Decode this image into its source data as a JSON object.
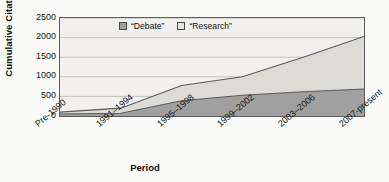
{
  "chart_data": {
    "type": "area",
    "stacked": true,
    "title": "",
    "xlabel": "Period",
    "ylabel": "Cumulative Citations",
    "categories": [
      "Pre-1990",
      "1991–1994",
      "1995–1998",
      "1999–2002",
      "2003–2006",
      "2007-present"
    ],
    "series": [
      {
        "name": "“Debate”",
        "values": [
          50,
          70,
          390,
          530,
          620,
          690
        ],
        "color": "#a0a0a0"
      },
      {
        "name": "“Research”",
        "values": [
          50,
          130,
          390,
          470,
          880,
          1340
        ],
        "color": "#dddbd6"
      }
    ],
    "cumulative_totals": [
      100,
      200,
      780,
      1000,
      1500,
      2030
    ],
    "ylim": [
      0,
      2500
    ],
    "yticks": [
      0,
      500,
      1000,
      1500,
      2000,
      2500
    ],
    "ytick_labels": [
      "0",
      "500",
      "1000",
      "1500",
      "2000",
      "2500"
    ],
    "grid": true,
    "legend_position": "top-center"
  },
  "legend": {
    "items": [
      {
        "label": "“Debate”",
        "color": "#a0a0a0"
      },
      {
        "label": "“Research”",
        "color": "#e6e4df"
      }
    ]
  },
  "colors": {
    "debate_fill": "#a0a0a0",
    "research_fill": "#dddbd6",
    "plot_background": "#f1f0ee",
    "line": "#5a5a5a",
    "grid": "#b2b0ac",
    "axis": "#4f4f4f",
    "text": "#131313"
  }
}
